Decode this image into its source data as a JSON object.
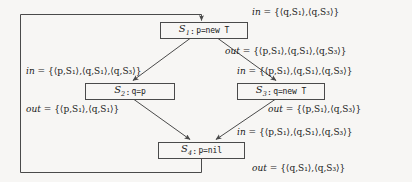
{
  "diagram": {
    "background_color": "#f7f6f4",
    "line_color": "#4a4a4a",
    "nodes": [
      {
        "id": "S1",
        "label_id": "S",
        "label_sub": "1",
        "separator": ":",
        "code": "p=new  T",
        "full_text": "S1 : p=new  T"
      },
      {
        "id": "S2",
        "label_id": "S",
        "label_sub": "2",
        "separator": ":",
        "code": "q=p",
        "full_text": "S2 : q=p"
      },
      {
        "id": "S3",
        "label_id": "S",
        "label_sub": "3",
        "separator": ":",
        "code": "q=new  T",
        "full_text": "S3 : q=new  T"
      },
      {
        "id": "S4",
        "label_id": "S",
        "label_sub": "4",
        "separator": ":",
        "code": "p=nil",
        "full_text": "S4 : p=nil"
      }
    ],
    "annotations": [
      {
        "name": "s1-in",
        "keyword": "in",
        "equals": "=",
        "set": "{⟨q,S₁⟩,⟨q,S₃⟩}",
        "pairs": [
          [
            "q",
            "S",
            "1"
          ],
          [
            "q",
            "S",
            "3"
          ]
        ]
      },
      {
        "name": "s1-out",
        "keyword": "out",
        "equals": "=",
        "set": "{⟨p,S₁⟩,⟨q,S₁⟩,⟨q,S₃⟩}",
        "pairs": [
          [
            "p",
            "S",
            "1"
          ],
          [
            "q",
            "S",
            "1"
          ],
          [
            "q",
            "S",
            "3"
          ]
        ]
      },
      {
        "name": "s2-in",
        "keyword": "in",
        "equals": "=",
        "set": "{⟨p,S₁⟩,⟨q,S₁⟩,⟨q,S₃⟩}",
        "pairs": [
          [
            "p",
            "S",
            "1"
          ],
          [
            "q",
            "S",
            "1"
          ],
          [
            "q",
            "S",
            "3"
          ]
        ]
      },
      {
        "name": "s2-out",
        "keyword": "out",
        "equals": "=",
        "set": "{⟨p,S₁⟩,⟨q,S₁⟩}",
        "pairs": [
          [
            "p",
            "S",
            "1"
          ],
          [
            "q",
            "S",
            "1"
          ]
        ]
      },
      {
        "name": "s3-in",
        "keyword": "in",
        "equals": "=",
        "set": "{⟨p,S₁⟩,⟨q,S₁⟩,⟨q,S₃⟩}",
        "pairs": [
          [
            "p",
            "S",
            "1"
          ],
          [
            "q",
            "S",
            "1"
          ],
          [
            "q",
            "S",
            "3"
          ]
        ]
      },
      {
        "name": "s3-out",
        "keyword": "out",
        "equals": "=",
        "set": "{⟨p,S₁⟩,⟨q,S₃⟩}",
        "pairs": [
          [
            "p",
            "S",
            "1"
          ],
          [
            "q",
            "S",
            "3"
          ]
        ]
      },
      {
        "name": "s4-in",
        "keyword": "in",
        "equals": "=",
        "set": "{⟨p,S₁⟩,⟨q,S₁⟩,⟨q,S₃⟩}",
        "pairs": [
          [
            "p",
            "S",
            "1"
          ],
          [
            "q",
            "S",
            "1"
          ],
          [
            "q",
            "S",
            "3"
          ]
        ]
      },
      {
        "name": "s4-out",
        "keyword": "out",
        "equals": "=",
        "set": "{⟨q,S₁⟩,⟨q,S₃⟩}",
        "pairs": [
          [
            "q",
            "S",
            "1"
          ],
          [
            "q",
            "S",
            "3"
          ]
        ]
      }
    ],
    "edges": [
      {
        "from": "entry",
        "to": "S1"
      },
      {
        "from": "S1",
        "to": "S2"
      },
      {
        "from": "S1",
        "to": "S3"
      },
      {
        "from": "S2",
        "to": "S4"
      },
      {
        "from": "S3",
        "to": "S4"
      },
      {
        "from": "S4",
        "to": "S1",
        "kind": "back-edge"
      }
    ]
  }
}
